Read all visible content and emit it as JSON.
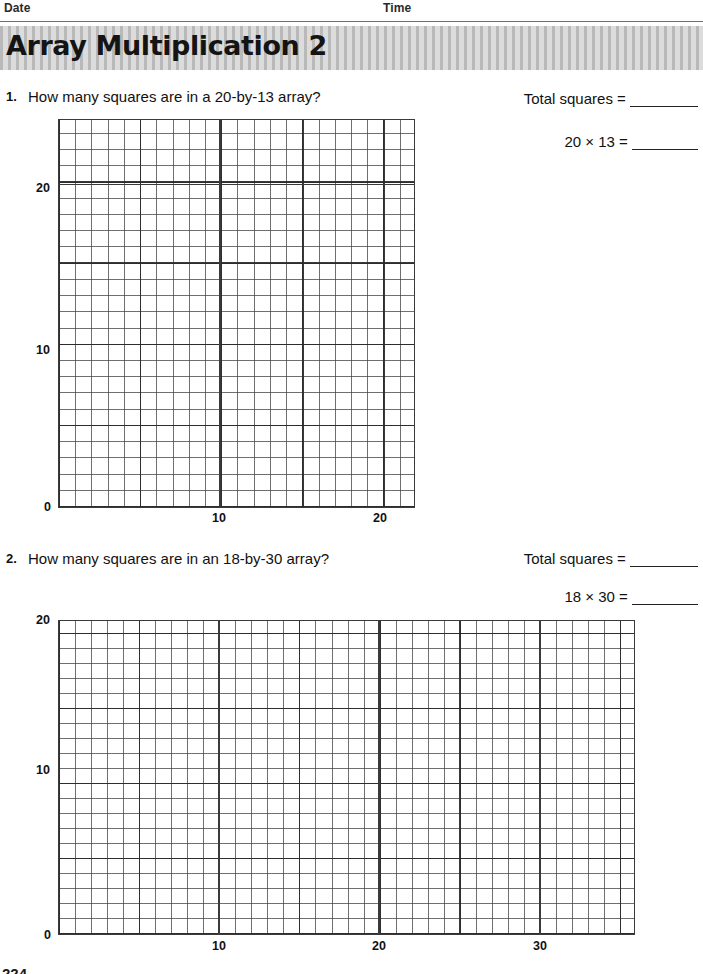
{
  "header": {
    "date_label": "Date",
    "time_label": "Time"
  },
  "banner": {
    "title": "Array Multiplication 2"
  },
  "problems": [
    {
      "number": "1.",
      "question": "How many squares are in a 20-by-13 array?",
      "answers": [
        {
          "label": "Total squares =",
          "value": ""
        },
        {
          "label": "20 × 13 =",
          "value": ""
        }
      ],
      "grid": {
        "x_ticks": [
          "10",
          "20"
        ],
        "y_ticks": [
          "0",
          "10",
          "20"
        ],
        "origin_label": "0",
        "columns": 22,
        "rows": 24,
        "major_every": 5
      }
    },
    {
      "number": "2.",
      "question": "How many squares are in an 18-by-30 array?",
      "answers": [
        {
          "label": "Total squares =",
          "value": ""
        },
        {
          "label": "18 × 30 =",
          "value": ""
        }
      ],
      "grid": {
        "x_ticks": [
          "10",
          "20",
          "30"
        ],
        "y_ticks": [
          "0",
          "10",
          "20"
        ],
        "origin_label": "0",
        "columns": 36,
        "rows": 21,
        "major_every": 5
      }
    }
  ],
  "footer": {
    "page_scrap": "224"
  }
}
